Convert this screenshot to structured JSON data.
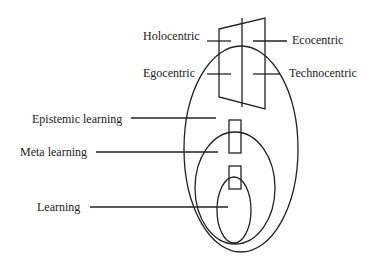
{
  "diagram": {
    "top_labels": {
      "holocentric": "Holocentric",
      "ecocentric": "Ecocentric",
      "egocentric": "Egocentric",
      "technocentric": "Technocentric"
    },
    "left_labels": {
      "epistemic": "Epistemic learning",
      "meta": "Meta learning",
      "learning": "Learning"
    },
    "colors": {
      "stroke": "#222222",
      "background": "#ffffff"
    }
  }
}
